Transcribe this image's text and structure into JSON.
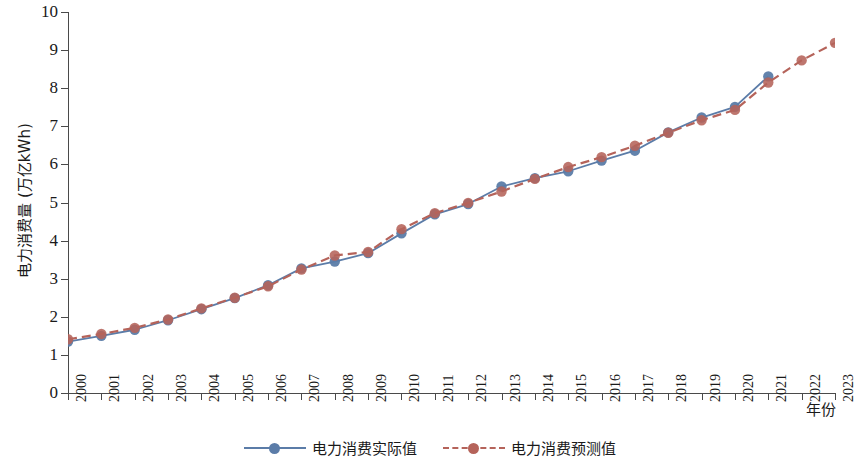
{
  "chart_data": {
    "type": "line",
    "title": "",
    "xlabel": "年份",
    "ylabel": "电力消费量 (万亿kWh)",
    "xlim": [
      2000,
      2023
    ],
    "ylim": [
      0,
      10
    ],
    "grid": false,
    "legend_position": "bottom-center",
    "y_ticks": [
      "0",
      "1",
      "2",
      "3",
      "4",
      "5",
      "6",
      "7",
      "8",
      "9",
      "10"
    ],
    "x_ticks": [
      "2000",
      "2001",
      "2002",
      "2003",
      "2004",
      "2005",
      "2006",
      "2007",
      "2008",
      "2009",
      "2010",
      "2011",
      "2012",
      "2013",
      "2014",
      "2015",
      "2016",
      "2017",
      "2018",
      "2019",
      "2020",
      "2021",
      "2022",
      "2023"
    ],
    "x": [
      2000,
      2001,
      2002,
      2003,
      2004,
      2005,
      2006,
      2007,
      2008,
      2009,
      2010,
      2011,
      2012,
      2013,
      2014,
      2015,
      2016,
      2017,
      2018,
      2019,
      2020,
      2021,
      2022,
      2023
    ],
    "series": [
      {
        "name": "电力消费实际值",
        "color": "#5b7ca8",
        "style": "solid",
        "marker": "circle",
        "values": [
          1.35,
          1.5,
          1.66,
          1.91,
          2.2,
          2.49,
          2.83,
          3.27,
          3.45,
          3.67,
          4.19,
          4.69,
          4.96,
          5.42,
          5.64,
          5.82,
          6.1,
          6.36,
          6.84,
          7.23,
          7.51,
          8.31,
          null,
          null
        ]
      },
      {
        "name": "电力消费预测值",
        "color": "#b5635a",
        "style": "dashed",
        "marker": "circle",
        "values": [
          1.41,
          1.55,
          1.71,
          1.93,
          2.22,
          2.5,
          2.8,
          3.24,
          3.61,
          3.7,
          4.3,
          4.72,
          4.99,
          5.29,
          5.62,
          5.93,
          6.19,
          6.49,
          6.83,
          7.16,
          7.43,
          8.15,
          8.73,
          9.19
        ]
      }
    ]
  }
}
